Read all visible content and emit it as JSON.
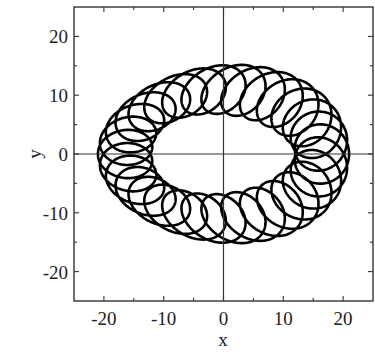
{
  "chart_data": {
    "type": "line",
    "title": "",
    "xlabel": "x",
    "ylabel": "y",
    "xlim": [
      -25,
      25
    ],
    "ylim": [
      -25,
      25
    ],
    "xticks": [
      -20,
      -10,
      0,
      10,
      20
    ],
    "yticks": [
      -20,
      -10,
      0,
      10,
      20
    ],
    "xtick_labels": [
      "-20",
      "-10",
      "0",
      "10",
      "20"
    ],
    "ytick_labels": [
      "-20",
      "-10",
      "0",
      "10",
      "20"
    ],
    "minor_ticks_step": 5,
    "grid": false,
    "zero_lines": true,
    "legend": null,
    "series": [
      {
        "name": "trajectory",
        "description": "Looping (precessing) closed trajectory: small loops whose centers travel around a large oval; outer extent x in [-21, 21], y in [-15, 15]; inner hole x in about [-12, 10], y in about [-7, 7].",
        "color": "#000000",
        "parametric": {
          "center_semi_axis_x": 16.5,
          "center_semi_axis_y": 11,
          "loop_radius_x": 4.5,
          "loop_radius_y": 4,
          "loops_per_revolution": 31
        },
        "extent": {
          "x_min": -21,
          "x_max": 21,
          "y_min": -15,
          "y_max": 15
        }
      }
    ]
  },
  "colors": {
    "curve": "#000000",
    "axes": "#333333",
    "background": "#ffffff"
  }
}
